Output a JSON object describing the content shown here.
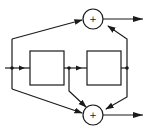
{
  "diagram": {
    "type": "block-diagram",
    "colors": {
      "stroke": "#1a1a1a",
      "background": "#ffffff"
    },
    "blocks": [
      {
        "id": "block-1",
        "label": ""
      },
      {
        "id": "block-2",
        "label": ""
      }
    ],
    "summing_junctions": [
      {
        "id": "sum-top",
        "symbol": "+"
      },
      {
        "id": "sum-bottom",
        "symbol": "+"
      }
    ],
    "nodes": [
      "input-node",
      "mid-node",
      "output-node"
    ],
    "edges": [
      {
        "from": "input",
        "to": "block-1"
      },
      {
        "from": "block-1",
        "to": "block-2"
      },
      {
        "from": "input-node",
        "to": "sum-top"
      },
      {
        "from": "input-node",
        "to": "sum-bottom"
      },
      {
        "from": "mid-node",
        "to": "sum-bottom"
      },
      {
        "from": "output-node",
        "to": "sum-top"
      },
      {
        "from": "output-node",
        "to": "sum-bottom"
      },
      {
        "from": "sum-top",
        "to": "output-top"
      },
      {
        "from": "sum-bottom",
        "to": "output-bottom"
      }
    ]
  }
}
